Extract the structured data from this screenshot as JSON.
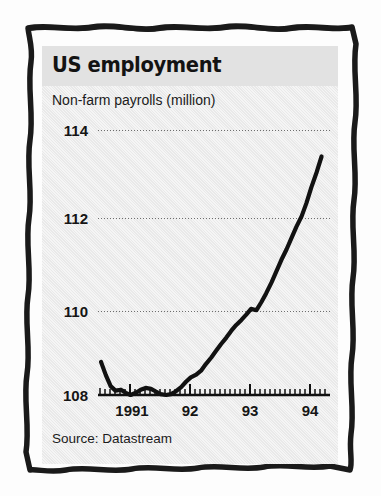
{
  "figure": {
    "title": "US employment",
    "axis_title": "Non-farm payrolls (million)",
    "source": "Source: Datastream",
    "border_style": "hand-drawn-wavy",
    "colors": {
      "ink": "#131313",
      "panel_background": "#e9e9e9",
      "title_band": "#e2e2e2",
      "gridline": "#6d6d6d",
      "series_line": "#111111",
      "page_background": "#ffffff"
    }
  },
  "chart_data": {
    "type": "line",
    "title": "US employment",
    "subtitle": "Non-farm payrolls (million)",
    "xlabel": "",
    "ylabel": "Non-farm payrolls (million)",
    "source": "Source: Datastream",
    "grid": true,
    "legend": "none",
    "ylim": [
      108,
      114.6
    ],
    "yticks": [
      108,
      110,
      112,
      114
    ],
    "ytick_labels": [
      "108",
      "110",
      "112",
      "114"
    ],
    "xlim": [
      1990.75,
      1994.6
    ],
    "xticks": [
      1991,
      1992,
      1993,
      1994
    ],
    "xtick_labels": [
      "1991",
      "92",
      "93",
      "94"
    ],
    "x_minor_ticks": "monthly",
    "series": [
      {
        "name": "Non-farm payrolls",
        "x": [
          1990.8,
          1990.88,
          1990.96,
          1991.04,
          1991.13,
          1991.21,
          1991.29,
          1991.38,
          1991.46,
          1991.54,
          1991.63,
          1991.71,
          1991.79,
          1991.88,
          1991.96,
          1992.04,
          1992.13,
          1992.21,
          1992.29,
          1992.38,
          1992.46,
          1992.54,
          1992.63,
          1992.71,
          1992.79,
          1992.88,
          1992.96,
          1993.04,
          1993.13,
          1993.21,
          1993.29,
          1993.38,
          1993.46,
          1993.54,
          1993.63,
          1993.71,
          1993.79,
          1993.88,
          1993.96,
          1994.04,
          1994.13,
          1994.21,
          1994.29,
          1994.38,
          1994.46
        ],
        "values": [
          108.75,
          108.45,
          108.2,
          108.1,
          108.12,
          108.05,
          108.0,
          108.05,
          108.12,
          108.16,
          108.14,
          108.08,
          108.02,
          108.0,
          108.02,
          108.08,
          108.18,
          108.3,
          108.4,
          108.46,
          108.55,
          108.7,
          108.85,
          109.0,
          109.15,
          109.3,
          109.45,
          109.58,
          109.7,
          109.82,
          109.95,
          109.92,
          110.1,
          110.3,
          110.55,
          110.8,
          111.05,
          111.3,
          111.55,
          111.8,
          112.05,
          112.35,
          112.7,
          113.05,
          113.4
        ]
      }
    ],
    "annotations": []
  }
}
